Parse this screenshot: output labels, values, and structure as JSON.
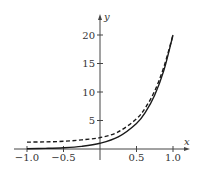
{
  "chart_data": {
    "type": "line",
    "title": "",
    "xlabel": "x",
    "ylabel": "y",
    "xlim": [
      -1.0,
      1.0
    ],
    "ylim": [
      0,
      20
    ],
    "grid": false,
    "legend": null,
    "x_ticks": [
      -1.0,
      -0.5,
      0.5,
      1.0
    ],
    "x_tick_labels": [
      "−1.0",
      "−0.5",
      "0.5",
      "1.0"
    ],
    "y_ticks": [
      5,
      10,
      15,
      20
    ],
    "y_tick_labels": [
      "5",
      "10",
      "15",
      "20"
    ],
    "x": [
      -1.0,
      -0.75,
      -0.5,
      -0.25,
      0.0,
      0.25,
      0.5,
      0.625,
      0.75,
      0.875,
      1.0
    ],
    "series": [
      {
        "name": "solid curve",
        "style": "solid",
        "values": [
          0.05,
          0.11,
          0.22,
          0.47,
          1.0,
          2.12,
          4.48,
          6.52,
          9.49,
          13.8,
          20.0
        ]
      },
      {
        "name": "dashed curve",
        "style": "dashed",
        "values": [
          1.2,
          1.25,
          1.35,
          1.6,
          2.0,
          3.0,
          5.3,
          7.3,
          10.2,
          14.4,
          20.0
        ]
      }
    ]
  },
  "colors": {
    "axis": "#444444",
    "curve": "#1a1a1a",
    "background": "#ffffff"
  }
}
